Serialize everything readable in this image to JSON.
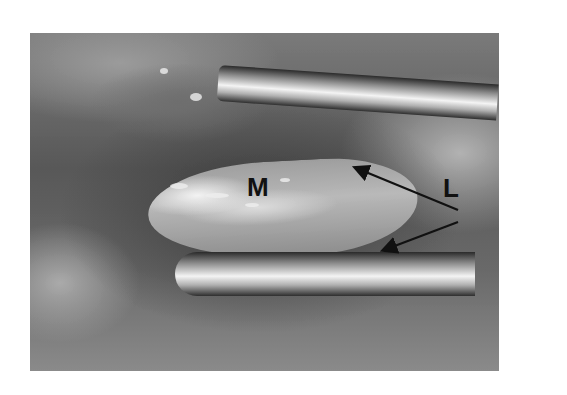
{
  "figure": {
    "labels": [
      {
        "id": "M",
        "text": "M"
      },
      {
        "id": "L",
        "text": "L"
      }
    ],
    "arrows": [
      {
        "from": "L",
        "to": "upper tissue edge"
      },
      {
        "from": "L",
        "to": "lower tissue edge"
      }
    ]
  }
}
